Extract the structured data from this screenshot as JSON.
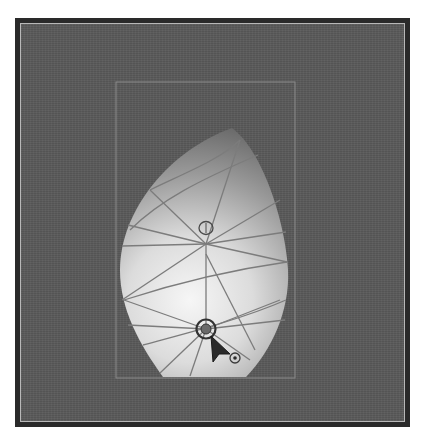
{
  "canvas": {
    "background_color": "#5a5a5a",
    "outer_border_color": "#2a2a2a",
    "frame_line_color": "#b8b8b8",
    "artboard_color": "#8a8a8a"
  },
  "mesh_object": {
    "shape": "teardrop",
    "gradient_center_color": "#f4f4f4",
    "gradient_edge_color": "#6c6c6c",
    "mesh_line_color": "#7a7a7a",
    "mesh_points": [
      {
        "name": "upper-mesh-point",
        "x": 206,
        "y": 228
      },
      {
        "name": "lower-mesh-point-selected",
        "x": 206,
        "y": 329
      }
    ]
  },
  "cursor": {
    "icon": "mesh-tool-arrow-cursor",
    "x": 210,
    "y": 336
  }
}
